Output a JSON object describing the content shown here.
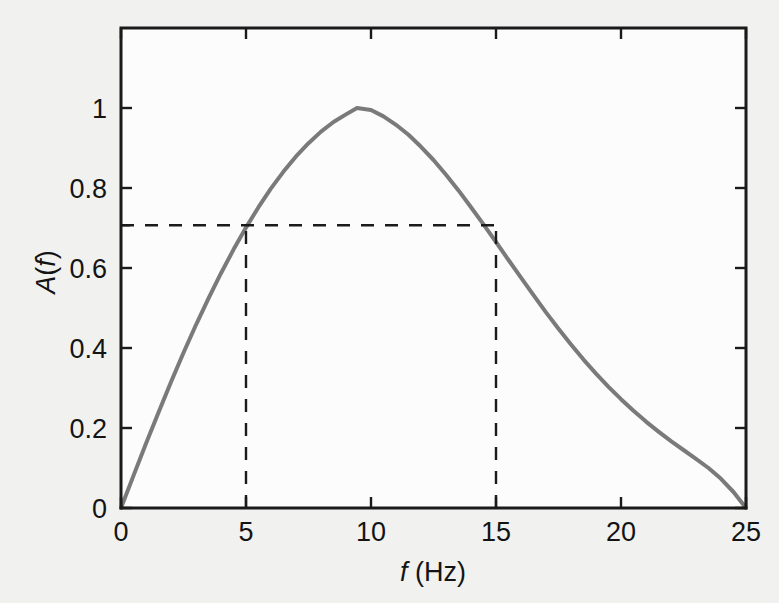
{
  "figure": {
    "background_color": "#f1f1f0",
    "plot_background_color": "#fcfcfc",
    "axis_color": "#1a1a1a",
    "curve_color": "#7a7a7a",
    "dash_color": "#1a1a1a",
    "text_color": "#141414"
  },
  "chart_data": {
    "type": "line",
    "title": "",
    "subtitle": "",
    "xlabel": "f (Hz)",
    "xlabel_parts": {
      "symbol": "f",
      "unit": "(Hz)"
    },
    "ylabel": "A(f)",
    "ylabel_parts": {
      "prefix": "A",
      "open": "(",
      "symbol": "f",
      "close": ")"
    },
    "xlim": [
      0,
      25
    ],
    "ylim": [
      0,
      1.2
    ],
    "grid": false,
    "legend": null,
    "legend_position": "none",
    "xticks": [
      0,
      5,
      10,
      15,
      20,
      25
    ],
    "xtick_labels": [
      "0",
      "5",
      "10",
      "15",
      "20",
      "25"
    ],
    "yticks": [
      0,
      0.2,
      0.4,
      0.6,
      0.8,
      1
    ],
    "ytick_labels": [
      "0",
      "0.2",
      "0.4",
      "0.6",
      "0.8",
      "1"
    ],
    "extra_yticks": [
      0.707
    ],
    "tick_direction": "in",
    "series": [
      {
        "name": "A(f)",
        "color": "#7a7a7a",
        "line_width": 4,
        "style": "solid",
        "x": [
          0,
          0.5,
          1,
          1.5,
          2,
          2.5,
          3,
          3.5,
          4,
          4.5,
          5,
          5.5,
          6,
          6.5,
          7,
          7.5,
          8,
          8.5,
          9,
          9.44,
          10,
          10.5,
          11,
          11.5,
          12,
          12.5,
          13,
          13.5,
          14,
          14.5,
          15,
          15.5,
          16,
          16.5,
          17,
          17.5,
          18,
          18.5,
          19,
          19.5,
          20,
          20.5,
          21,
          21.5,
          22,
          22.5,
          23,
          23.5,
          24,
          24.5,
          25
        ],
        "y": [
          0,
          0.081,
          0.161,
          0.239,
          0.315,
          0.388,
          0.458,
          0.524,
          0.587,
          0.646,
          0.701,
          0.752,
          0.799,
          0.841,
          0.879,
          0.912,
          0.941,
          0.965,
          0.984,
          1.0,
          0.995,
          0.979,
          0.958,
          0.933,
          0.903,
          0.87,
          0.833,
          0.794,
          0.752,
          0.709,
          0.665,
          0.62,
          0.576,
          0.532,
          0.489,
          0.448,
          0.409,
          0.371,
          0.336,
          0.303,
          0.272,
          0.243,
          0.216,
          0.191,
          0.167,
          0.145,
          0.123,
          0.1,
          0.073,
          0.04,
          0
        ]
      }
    ],
    "annotations": [
      {
        "name": "half-power-horizontal-line",
        "kind": "hline",
        "y": 0.707,
        "x_from": 0,
        "x_to": 15,
        "style": "dashed",
        "color": "#1a1a1a"
      },
      {
        "name": "lower-cutoff-vertical-line",
        "kind": "vline",
        "x": 5,
        "y_from": 0,
        "y_to": 0.707,
        "style": "dashed",
        "color": "#1a1a1a"
      },
      {
        "name": "upper-cutoff-vertical-line",
        "kind": "vline",
        "x": 15,
        "y_from": 0,
        "y_to": 0.707,
        "style": "dashed",
        "color": "#1a1a1a"
      }
    ],
    "peak": {
      "x": 9.44,
      "y": 1.0
    },
    "cutoffs": {
      "lower": 5,
      "upper": 15,
      "level": 0.707
    }
  }
}
